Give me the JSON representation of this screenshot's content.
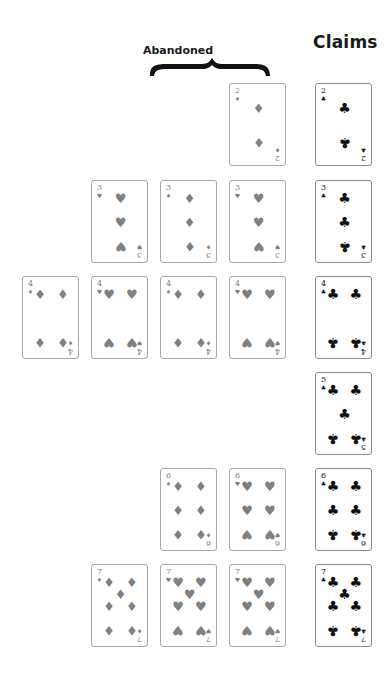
{
  "labels": {
    "claims": "Claims",
    "abandoned": "Abandoned"
  },
  "colors": {
    "abandoned_suit": "#808080",
    "claim_suit": "#111111",
    "card_border": "#a8a8a8"
  },
  "suit_glyphs": {
    "clubs": "♣",
    "diamonds": "♦",
    "hearts": "♥"
  },
  "claims": [
    {
      "rank": "2",
      "suit": "clubs"
    },
    {
      "rank": "3",
      "suit": "clubs"
    },
    {
      "rank": "4",
      "suit": "clubs"
    },
    {
      "rank": "5",
      "suit": "clubs"
    },
    {
      "rank": "6",
      "suit": "clubs"
    },
    {
      "rank": "7",
      "suit": "clubs"
    }
  ],
  "abandoned_rows": [
    {
      "rank": "2",
      "cards": [
        {
          "suit": "diamonds"
        }
      ]
    },
    {
      "rank": "3",
      "cards": [
        {
          "suit": "hearts"
        },
        {
          "suit": "diamonds"
        },
        {
          "suit": "hearts"
        }
      ]
    },
    {
      "rank": "4",
      "cards": [
        {
          "suit": "diamonds"
        },
        {
          "suit": "hearts"
        },
        {
          "suit": "diamonds"
        },
        {
          "suit": "hearts"
        }
      ]
    },
    {
      "rank": "5",
      "cards": []
    },
    {
      "rank": "6",
      "cards": [
        {
          "suit": "diamonds"
        },
        {
          "suit": "hearts"
        }
      ]
    },
    {
      "rank": "7",
      "cards": [
        {
          "suit": "diamonds"
        },
        {
          "suit": "hearts"
        },
        {
          "suit": "hearts"
        }
      ]
    }
  ]
}
